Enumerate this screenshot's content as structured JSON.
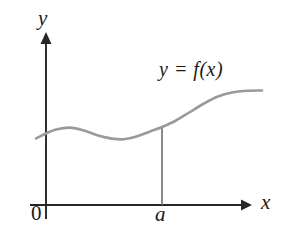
{
  "figure": {
    "kind": "cartesian-graph",
    "background_color": "#ffffff",
    "width": 283,
    "height": 241
  },
  "axes": {
    "color": "#262626",
    "x_axis": {
      "label": "x",
      "origin_label": "0",
      "line_y": 205,
      "line_x_start": 30,
      "line_x_end": 250,
      "arrow": "right"
    },
    "y_axis": {
      "label": "y",
      "line_x": 46,
      "line_y_start": 218,
      "line_y_end": 33,
      "arrow": "up"
    }
  },
  "curve": {
    "label": "y = f(x)",
    "color": "#9a9a9a",
    "stroke_width": 2.6,
    "points": [
      [
        36,
        138.5
      ],
      [
        46,
        133.5
      ],
      [
        56,
        129.5
      ],
      [
        70,
        127.6
      ],
      [
        84,
        130.5
      ],
      [
        98,
        135.5
      ],
      [
        112,
        138.6
      ],
      [
        124,
        139.2
      ],
      [
        138,
        136.0
      ],
      [
        150,
        131.5
      ],
      [
        162,
        127.0
      ],
      [
        176,
        120.5
      ],
      [
        190,
        112.0
      ],
      [
        204,
        103.5
      ],
      [
        218,
        96.5
      ],
      [
        232,
        92.5
      ],
      [
        246,
        90.8
      ],
      [
        262,
        90.5
      ]
    ]
  },
  "vertical_segment": {
    "label": "a",
    "color": "#6e6e6e",
    "x": 162,
    "y_top": 127,
    "y_bottom": 205,
    "stroke_width": 1.6
  },
  "chart_data": {
    "type": "line",
    "title": "",
    "xlabel": "x",
    "ylabel": "y",
    "annotations": [
      "y = f(x)",
      "a",
      "0"
    ],
    "series": [
      {
        "name": "y = f(x)",
        "x": [
          36,
          46,
          56,
          70,
          84,
          98,
          112,
          124,
          138,
          150,
          162,
          176,
          190,
          204,
          218,
          232,
          246,
          262
        ],
        "values": [
          138.5,
          133.5,
          129.5,
          127.6,
          130.5,
          135.5,
          138.6,
          139.2,
          136.0,
          131.5,
          127.0,
          120.5,
          112.0,
          103.5,
          96.5,
          92.5,
          90.8,
          90.5
        ]
      }
    ],
    "markers": [
      {
        "name": "a",
        "x": 162,
        "type": "vertical-line-to-curve"
      }
    ],
    "grid": false,
    "legend": "none"
  }
}
